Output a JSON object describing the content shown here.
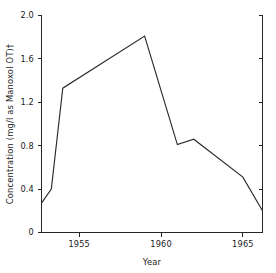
{
  "chart_data": {
    "type": "line",
    "title": "",
    "xlabel": "Year",
    "ylabel": "Concentration (mg/l as Manoxol OT)†",
    "xlim": [
      1952.7,
      1966.2
    ],
    "ylim": [
      0,
      2.0
    ],
    "grid": false,
    "legend": "none",
    "x_ticks": [
      1955,
      1960,
      1965
    ],
    "x_tick_labels": [
      "1955",
      "1960",
      "1965"
    ],
    "y_ticks": [
      0,
      0.4,
      0.8,
      1.2,
      1.6,
      2.0
    ],
    "y_tick_labels": [
      "0",
      "0.4",
      "0.8",
      "1.2",
      "1.6",
      "2.0"
    ],
    "series": [
      {
        "name": "Concentration",
        "color": "#2b2b2b",
        "x": [
          1952.7,
          1953.3,
          1954.0,
          1959.0,
          1961.0,
          1962.0,
          1965.0,
          1966.2
        ],
        "y": [
          0.27,
          0.4,
          1.33,
          1.81,
          0.81,
          0.86,
          0.51,
          0.2
        ]
      }
    ]
  },
  "axes": {
    "y_title": "Concentration (mg/l as Manoxol OT)†",
    "x_title": "Year"
  },
  "y_tick_text": {
    "t0": "2.0",
    "t1": "1.6",
    "t2": "1.2",
    "t3": "0.8",
    "t4": "0.4",
    "t5": "0"
  },
  "x_tick_text": {
    "t0": "1955",
    "t1": "1960",
    "t2": "1965"
  }
}
